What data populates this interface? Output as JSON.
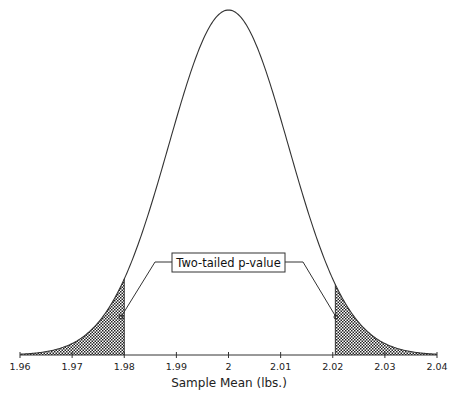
{
  "chart_data": {
    "type": "area",
    "title": "",
    "xlabel": "Sample Mean (lbs.)",
    "ylabel": "",
    "xlim": [
      1.96,
      2.04
    ],
    "x_ticks": [
      1.96,
      1.97,
      1.98,
      1.99,
      2,
      2.01,
      2.02,
      2.03,
      2.04
    ],
    "x_tick_labels": [
      "1.96",
      "1.97",
      "1.98",
      "1.99",
      "2",
      "2.01",
      "2.02",
      "2.03",
      "2.04"
    ],
    "grid": false,
    "legend": null,
    "series": [
      {
        "name": "Sampling distribution of the mean",
        "distribution": "normal",
        "mean": 2.0,
        "std_dev": 0.0115
      }
    ],
    "shaded_regions": [
      {
        "name": "left tail",
        "from": 1.96,
        "to": 1.98,
        "pattern": "crosshatch"
      },
      {
        "name": "right tail",
        "from": 2.0205,
        "to": 2.04,
        "pattern": "crosshatch"
      }
    ],
    "annotations": [
      {
        "text": "Two-tailed p-value",
        "points_to": [
          "left tail",
          "right tail"
        ]
      }
    ]
  },
  "labels": {
    "ticks": [
      "1.96",
      "1.97",
      "1.98",
      "1.99",
      "2",
      "2.01",
      "2.02",
      "2.03",
      "2.04"
    ],
    "x_axis_title": "Sample Mean (lbs.)",
    "callout": "Two-tailed p-value"
  }
}
